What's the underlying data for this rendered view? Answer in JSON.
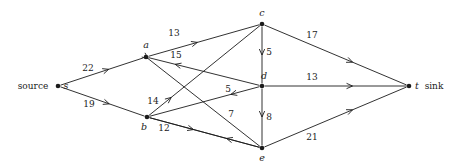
{
  "figure": {
    "kind": "flow-network-diagram",
    "background": "#ffffff",
    "ink": "#1b1b1b"
  },
  "nodes": [
    {
      "id": "s",
      "label": "s",
      "prefix": "source",
      "suffix": "",
      "x": 58,
      "y": 86,
      "label_x": 66,
      "label_y": 86,
      "prefix_x": 33,
      "prefix_y": 86
    },
    {
      "id": "a",
      "label": "a",
      "prefix": "",
      "suffix": "",
      "x": 146,
      "y": 57,
      "label_x": 146,
      "label_y": 45
    },
    {
      "id": "b",
      "label": "b",
      "prefix": "",
      "suffix": "",
      "x": 147,
      "y": 117,
      "label_x": 144,
      "label_y": 127
    },
    {
      "id": "c",
      "label": "c",
      "prefix": "",
      "suffix": "",
      "x": 262,
      "y": 24,
      "label_x": 262,
      "label_y": 13
    },
    {
      "id": "d",
      "label": "d",
      "prefix": "",
      "suffix": "",
      "x": 262,
      "y": 86,
      "label_x": 264,
      "label_y": 76
    },
    {
      "id": "e",
      "label": "e",
      "prefix": "",
      "suffix": "",
      "x": 262,
      "y": 148,
      "label_x": 262,
      "label_y": 158
    },
    {
      "id": "t",
      "label": "t",
      "prefix": "",
      "suffix": "sink",
      "x": 409,
      "y": 86,
      "label_x": 417,
      "label_y": 86,
      "suffix_x": 434,
      "suffix_y": 86
    }
  ],
  "edges": [
    {
      "from": "s",
      "to": "a",
      "capacity": "22",
      "label_x": 88,
      "label_y": 68,
      "arrow_t": 0.58
    },
    {
      "from": "s",
      "to": "b",
      "capacity": "19",
      "label_x": 89,
      "label_y": 104,
      "arrow_t": 0.58
    },
    {
      "from": "a",
      "to": "c",
      "capacity": "13",
      "label_x": 174,
      "label_y": 33,
      "arrow_t": 0.44
    },
    {
      "from": "d",
      "to": "a",
      "capacity": "15",
      "label_x": 176,
      "label_y": 55,
      "arrow_t": 0.76
    },
    {
      "from": "a",
      "to": "e",
      "capacity": "",
      "label_x": 0,
      "label_y": 0,
      "arrow_t": 0.0
    },
    {
      "from": "b",
      "to": "c",
      "capacity": "14",
      "label_x": 153,
      "label_y": 101,
      "arrow_t": 0.2
    },
    {
      "from": "b",
      "to": "e",
      "capacity": "12",
      "label_x": 164,
      "label_y": 128,
      "arrow_t": 0.4
    },
    {
      "from": "d",
      "to": "b",
      "capacity": "5",
      "label_x": 228,
      "label_y": 89,
      "arrow_t": 0.26
    },
    {
      "from": "e",
      "to": "b",
      "capacity": "7",
      "label_x": 231,
      "label_y": 114,
      "arrow_t": 0.3
    },
    {
      "from": "c",
      "to": "d",
      "capacity": "5",
      "label_x": 269,
      "label_y": 52,
      "arrow_t": 0.5
    },
    {
      "from": "d",
      "to": "e",
      "capacity": "8",
      "label_x": 269,
      "label_y": 117,
      "arrow_t": 0.5
    },
    {
      "from": "c",
      "to": "t",
      "capacity": "17",
      "label_x": 312,
      "label_y": 35,
      "arrow_t": 0.62
    },
    {
      "from": "d",
      "to": "t",
      "capacity": "13",
      "label_x": 312,
      "label_y": 77,
      "arrow_t": 0.62
    },
    {
      "from": "e",
      "to": "t",
      "capacity": "21",
      "label_x": 312,
      "label_y": 137,
      "arrow_t": 0.62
    }
  ],
  "chart_data": {
    "type": "diagram",
    "title": "",
    "graph_type": "directed flow network",
    "node_ids": [
      "s",
      "a",
      "b",
      "c",
      "d",
      "e",
      "t"
    ],
    "source": "s",
    "sink": "t",
    "edge_list": [
      [
        "s",
        "a",
        22
      ],
      [
        "s",
        "b",
        19
      ],
      [
        "a",
        "c",
        13
      ],
      [
        "a",
        "e",
        null
      ],
      [
        "d",
        "a",
        15
      ],
      [
        "b",
        "c",
        14
      ],
      [
        "b",
        "e",
        12
      ],
      [
        "d",
        "b",
        5
      ],
      [
        "e",
        "b",
        7
      ],
      [
        "c",
        "d",
        5
      ],
      [
        "d",
        "e",
        8
      ],
      [
        "c",
        "t",
        17
      ],
      [
        "d",
        "t",
        13
      ],
      [
        "e",
        "t",
        21
      ]
    ],
    "capacities": [
      22,
      19,
      13,
      15,
      14,
      12,
      5,
      7,
      5,
      8,
      17,
      13,
      21
    ]
  }
}
